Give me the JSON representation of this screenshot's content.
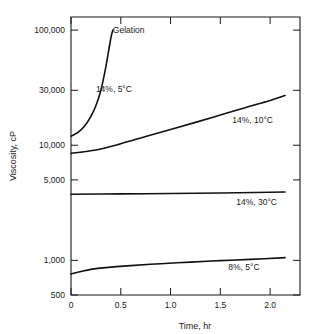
{
  "chart_data": {
    "type": "line",
    "title": "",
    "subtitle": "",
    "xlabel": "Time, hr",
    "ylabel": "Viscosity, cP",
    "xlim": [
      0,
      2.3
    ],
    "ylim": [
      500,
      130000
    ],
    "yscale": "log",
    "xscale": "linear",
    "grid": false,
    "legend_position": "inline-annotations",
    "xticks": [
      0,
      0.5,
      1.0,
      1.5,
      2.0
    ],
    "xtick_labels": [
      "0",
      "0.5",
      "1.0",
      "1.5",
      "2.0"
    ],
    "yticks": [
      500,
      1000,
      5000,
      10000,
      30000,
      100000
    ],
    "ytick_labels": [
      "500",
      "1,000",
      "5,000",
      "10,000",
      "30,000",
      "100,000"
    ],
    "annotations": [
      {
        "text": "Gelation",
        "x": 0.42,
        "y": 95000
      },
      {
        "text": "14%, 5°C",
        "x": 0.25,
        "y": 29000
      },
      {
        "text": "14%, 10°C",
        "x": 1.62,
        "y": 15500
      },
      {
        "text": "14%, 30°C",
        "x": 1.66,
        "y": 3000
      },
      {
        "text": "8%, 5°C",
        "x": 1.58,
        "y": 820
      }
    ],
    "series": [
      {
        "name": "14%, 5°C",
        "label": "14%, 5°C",
        "color": "#111111",
        "points": [
          [
            0.0,
            12000
          ],
          [
            0.05,
            12600
          ],
          [
            0.1,
            13600
          ],
          [
            0.15,
            15200
          ],
          [
            0.2,
            17800
          ],
          [
            0.25,
            22000
          ],
          [
            0.3,
            30000
          ],
          [
            0.35,
            48000
          ],
          [
            0.4,
            85000
          ],
          [
            0.42,
            100000
          ]
        ]
      },
      {
        "name": "14%, 10°C",
        "label": "14%, 10°C",
        "color": "#111111",
        "points": [
          [
            0.0,
            8500
          ],
          [
            0.25,
            9100
          ],
          [
            0.5,
            10300
          ],
          [
            0.75,
            11900
          ],
          [
            1.0,
            13700
          ],
          [
            1.25,
            15800
          ],
          [
            1.5,
            18300
          ],
          [
            1.75,
            21200
          ],
          [
            2.0,
            24500
          ],
          [
            2.15,
            27000
          ]
        ]
      },
      {
        "name": "14%, 30°C",
        "label": "14%, 30°C",
        "color": "#111111",
        "points": [
          [
            0.0,
            3750
          ],
          [
            0.5,
            3780
          ],
          [
            1.0,
            3810
          ],
          [
            1.5,
            3850
          ],
          [
            2.0,
            3900
          ],
          [
            2.15,
            3920
          ]
        ]
      },
      {
        "name": "8%, 5°C",
        "label": "8%, 5°C",
        "color": "#111111",
        "points": [
          [
            0.0,
            760
          ],
          [
            0.1,
            800
          ],
          [
            0.2,
            835
          ],
          [
            0.35,
            865
          ],
          [
            0.6,
            900
          ],
          [
            0.9,
            935
          ],
          [
            1.2,
            965
          ],
          [
            1.5,
            995
          ],
          [
            1.8,
            1020
          ],
          [
            2.15,
            1055
          ]
        ]
      }
    ]
  }
}
